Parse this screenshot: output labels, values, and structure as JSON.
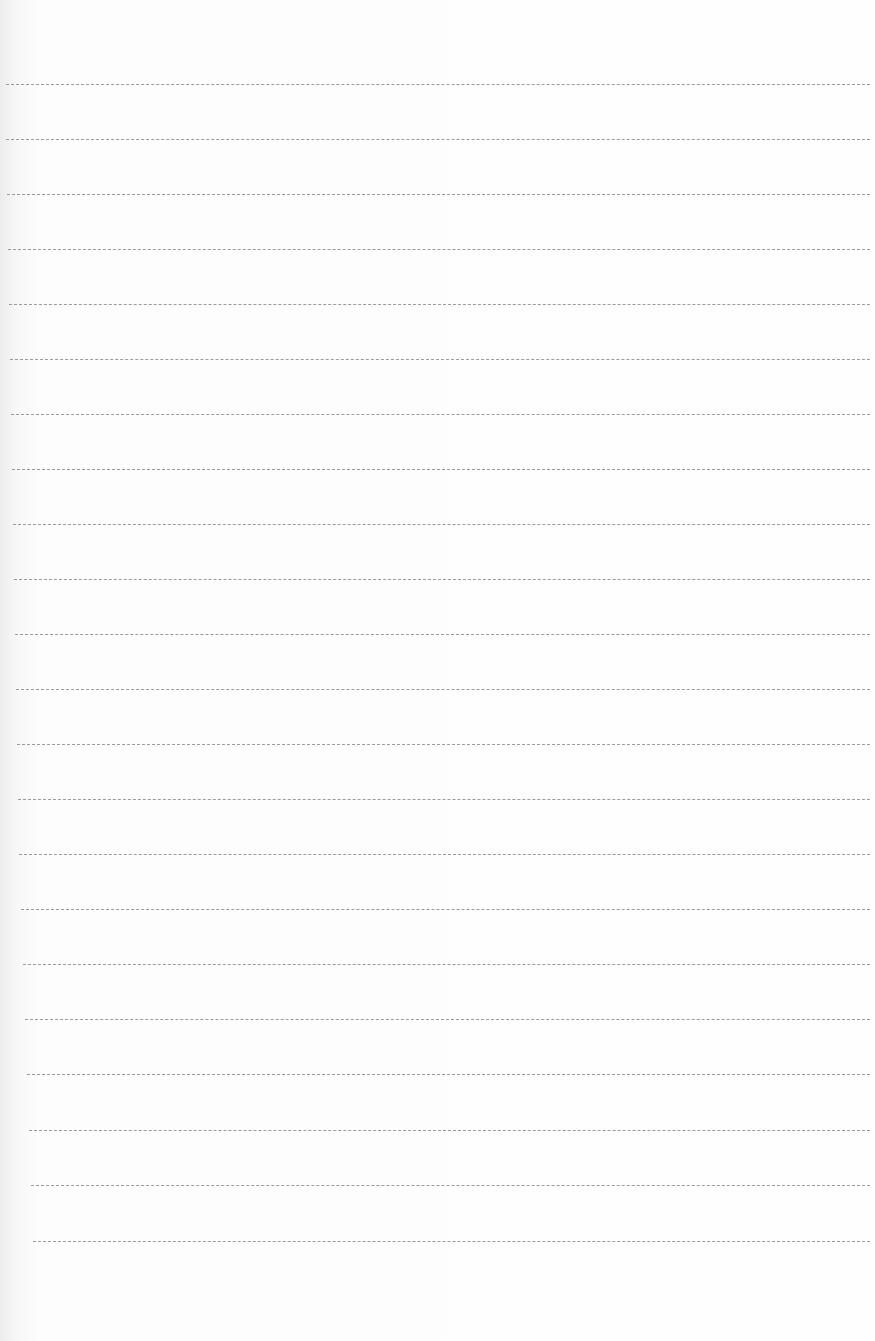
{
  "document": {
    "type": "blank lined paper",
    "paper_color": "#fdfdfd",
    "rule_color": "#8a8a8a",
    "rules": [
      {
        "y": 84,
        "x1": 6,
        "x2": 870
      },
      {
        "y": 139,
        "x1": 6,
        "x2": 870
      },
      {
        "y": 194,
        "x1": 7,
        "x2": 870
      },
      {
        "y": 249,
        "x1": 8,
        "x2": 870
      },
      {
        "y": 304,
        "x1": 9,
        "x2": 870
      },
      {
        "y": 359,
        "x1": 10,
        "x2": 870
      },
      {
        "y": 414,
        "x1": 11,
        "x2": 870
      },
      {
        "y": 469,
        "x1": 12,
        "x2": 870
      },
      {
        "y": 524,
        "x1": 13,
        "x2": 870
      },
      {
        "y": 579,
        "x1": 14,
        "x2": 870
      },
      {
        "y": 634,
        "x1": 15,
        "x2": 870
      },
      {
        "y": 689,
        "x1": 16,
        "x2": 870
      },
      {
        "y": 744,
        "x1": 17,
        "x2": 870
      },
      {
        "y": 799,
        "x1": 18,
        "x2": 870
      },
      {
        "y": 854,
        "x1": 19,
        "x2": 870
      },
      {
        "y": 909,
        "x1": 21,
        "x2": 870
      },
      {
        "y": 964,
        "x1": 23,
        "x2": 870
      },
      {
        "y": 1019,
        "x1": 25,
        "x2": 870
      },
      {
        "y": 1074,
        "x1": 27,
        "x2": 870
      },
      {
        "y": 1130,
        "x1": 29,
        "x2": 870
      },
      {
        "y": 1185,
        "x1": 31,
        "x2": 870
      },
      {
        "y": 1241,
        "x1": 33,
        "x2": 870
      }
    ]
  }
}
